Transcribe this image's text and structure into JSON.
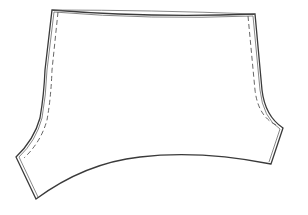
{
  "figure": {
    "type": "garment-flat-sketch",
    "colors": {
      "background": "#ffffff",
      "outline": "#3a3a3a",
      "stitch": "#555555"
    }
  }
}
